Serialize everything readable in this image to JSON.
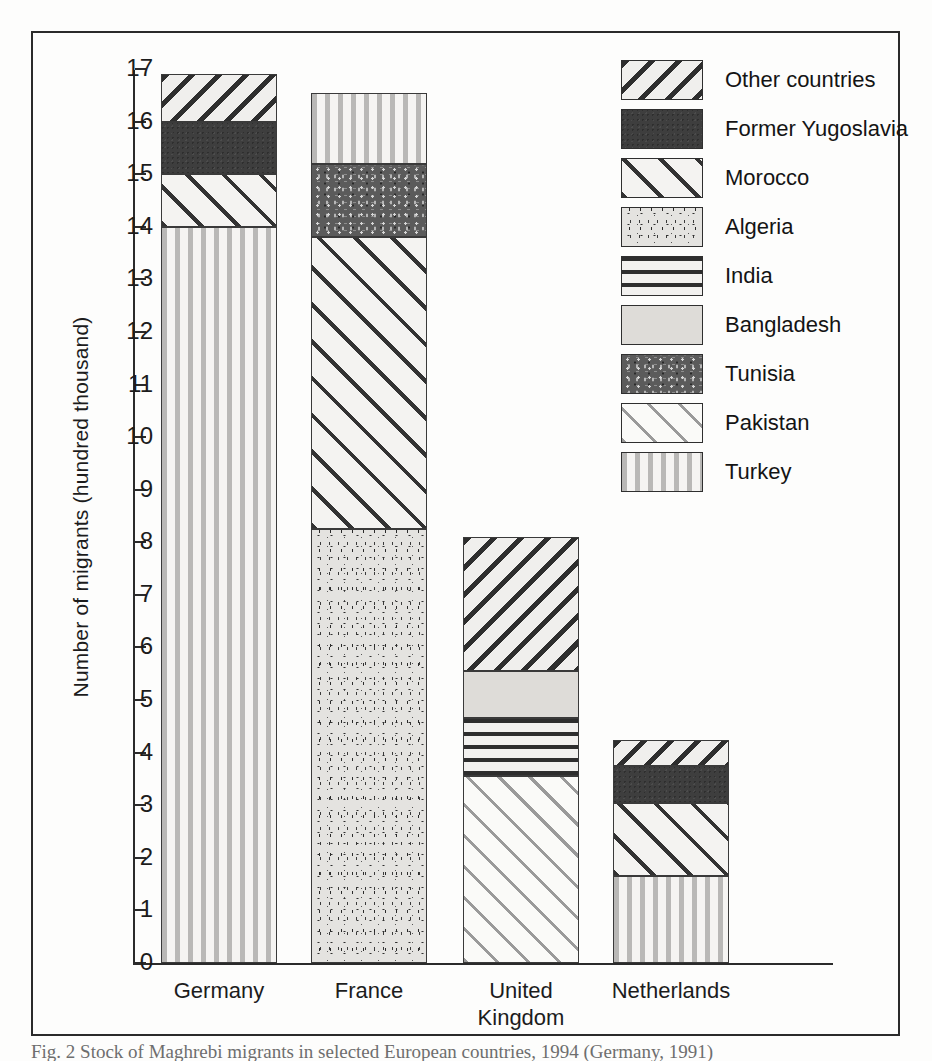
{
  "figure": {
    "caption": "Fig. 2 Stock of Maghrebi migrants in selected European countries, 1994 (Germany, 1991)"
  },
  "chart_data": {
    "type": "bar",
    "subtype": "stacked-bar",
    "title": "",
    "xlabel": "",
    "ylabel": "Number of migrants (hundred thousand)",
    "ylim": [
      0,
      17
    ],
    "ytick_labels": [
      "0",
      "1",
      "2",
      "3",
      "4",
      "5",
      "6",
      "7",
      "8",
      "9",
      "10",
      "11",
      "12",
      "13",
      "14",
      "15",
      "16",
      "17"
    ],
    "ytick_values": [
      0,
      1,
      2,
      3,
      4,
      5,
      6,
      7,
      8,
      9,
      10,
      11,
      12,
      13,
      14,
      15,
      16,
      17
    ],
    "grid": false,
    "legend_position": "right-top",
    "categories": [
      "Germany",
      "France",
      "United Kingdom",
      "Netherlands"
    ],
    "category_labels": [
      [
        "Germany"
      ],
      [
        "France"
      ],
      [
        "United",
        "Kingdom"
      ],
      [
        "Netherlands"
      ]
    ],
    "series": [
      {
        "name": "Turkey",
        "pattern": "vertical-stripes",
        "values": [
          14.0,
          1.35,
          0.0,
          1.65
        ]
      },
      {
        "name": "Pakistan",
        "pattern": "light-diagonal",
        "values": [
          0.0,
          0.0,
          3.55,
          0.0
        ]
      },
      {
        "name": "Tunisia",
        "pattern": "dark-speckle",
        "values": [
          0.0,
          1.4,
          0.0,
          0.0
        ]
      },
      {
        "name": "Bangladesh",
        "pattern": "solid-light-grey",
        "values": [
          0.0,
          0.0,
          0.9,
          0.0
        ]
      },
      {
        "name": "India",
        "pattern": "horizontal-stripes",
        "values": [
          0.0,
          0.0,
          1.1,
          0.0
        ]
      },
      {
        "name": "Algeria",
        "pattern": "speckle",
        "values": [
          0.0,
          8.25,
          0.0,
          0.0
        ]
      },
      {
        "name": "Morocco",
        "pattern": "wide-diagonal",
        "values": [
          1.0,
          5.55,
          0.0,
          1.4
        ]
      },
      {
        "name": "Former Yugoslavia",
        "pattern": "solid-dark",
        "values": [
          1.0,
          0.0,
          0.0,
          0.7
        ]
      },
      {
        "name": "Other countries",
        "pattern": "dense-diagonal",
        "values": [
          0.9,
          0.0,
          2.55,
          0.5
        ]
      }
    ],
    "stack_order_bottom_to_top": {
      "Germany": [
        "Turkey",
        "Morocco",
        "Former Yugoslavia",
        "Other countries"
      ],
      "France": [
        "Algeria",
        "Morocco",
        "Tunisia",
        "Turkey"
      ],
      "United Kingdom": [
        "Pakistan",
        "India",
        "Bangladesh",
        "Other countries"
      ],
      "Netherlands": [
        "Turkey",
        "Morocco",
        "Former Yugoslavia",
        "Other countries"
      ]
    },
    "totals": [
      16.9,
      16.55,
      8.1,
      4.25
    ]
  },
  "legend": {
    "items": [
      {
        "label": "Other countries",
        "pattern": "dense-diagonal"
      },
      {
        "label": "Former Yugoslavia",
        "pattern": "solid-dark"
      },
      {
        "label": "Morocco",
        "pattern": "wide-diagonal"
      },
      {
        "label": "Algeria",
        "pattern": "speckle"
      },
      {
        "label": "India",
        "pattern": "horizontal-stripes"
      },
      {
        "label": "Bangladesh",
        "pattern": "solid-light-grey"
      },
      {
        "label": "Tunisia",
        "pattern": "dark-speckle"
      },
      {
        "label": "Pakistan",
        "pattern": "light-diagonal"
      },
      {
        "label": "Turkey",
        "pattern": "vertical-stripes"
      }
    ]
  },
  "colors": {
    "ink": "#1c1c1c",
    "frame": "#2b2b2b",
    "solid_dark": "#3e3e3e",
    "solid_light_grey": "#dedcd8",
    "background": "#fdfdfc"
  }
}
